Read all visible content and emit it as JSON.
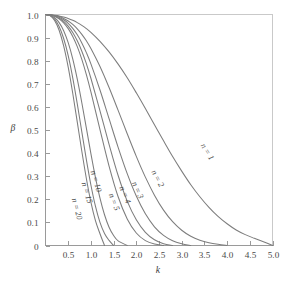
{
  "chart_data": {
    "type": "line",
    "title": "",
    "subtitle": "",
    "xlabel": "k",
    "ylabel": "β",
    "xlim": [
      0,
      5
    ],
    "ylim": [
      0,
      1
    ],
    "grid": false,
    "legend_position": "inline-curve-labels",
    "xticks": [
      0.5,
      1.0,
      1.5,
      2.0,
      2.5,
      3.0,
      3.5,
      4.0,
      4.5,
      5.0
    ],
    "xtick_labels": [
      "0.5",
      "1.0",
      "1.5",
      "2.0",
      "2.5",
      "3.0",
      "3.5",
      "4.0",
      "4.5",
      "5.0"
    ],
    "yticks": [
      0,
      0.1,
      0.2,
      0.3,
      0.4,
      0.5,
      0.6,
      0.7,
      0.8,
      0.9,
      1.0
    ],
    "ytick_labels": [
      "0",
      "0.1",
      "0.2",
      "0.3",
      "0.4",
      "0.5",
      "0.6",
      "0.7",
      "0.8",
      "0.9",
      "1.0"
    ],
    "series": [
      {
        "name": "n = 1",
        "label": "n = 1",
        "label_x": 3.52,
        "label_y": 0.4,
        "label_rotation": 58,
        "x": [
          0.0,
          0.1,
          0.2,
          0.3,
          0.4,
          0.5,
          0.6,
          0.7,
          0.8,
          0.9,
          1.0,
          1.2,
          1.4,
          1.6,
          1.8,
          2.0,
          2.2,
          2.4,
          2.6,
          2.8,
          3.0,
          3.2,
          3.4,
          3.6,
          3.8,
          4.0,
          4.2,
          4.4,
          4.6,
          4.8,
          5.0
        ],
        "y": [
          1.0,
          0.999,
          0.997,
          0.994,
          0.989,
          0.983,
          0.975,
          0.965,
          0.953,
          0.939,
          0.923,
          0.884,
          0.838,
          0.785,
          0.726,
          0.661,
          0.593,
          0.523,
          0.453,
          0.385,
          0.322,
          0.263,
          0.211,
          0.165,
          0.126,
          0.094,
          0.067,
          0.047,
          0.031,
          0.016,
          0.0
        ]
      },
      {
        "name": "n = 2",
        "label": "n = 2",
        "label_x": 2.42,
        "label_y": 0.285,
        "label_rotation": 62,
        "x": [
          0.0,
          0.1,
          0.2,
          0.3,
          0.4,
          0.5,
          0.6,
          0.7,
          0.8,
          0.9,
          1.0,
          1.2,
          1.4,
          1.6,
          1.8,
          2.0,
          2.2,
          2.4,
          2.6,
          2.8,
          3.0,
          3.2,
          3.4,
          3.6,
          3.8,
          4.0
        ],
        "y": [
          1.0,
          0.999,
          0.996,
          0.991,
          0.983,
          0.972,
          0.957,
          0.938,
          0.914,
          0.886,
          0.853,
          0.775,
          0.684,
          0.585,
          0.484,
          0.386,
          0.296,
          0.218,
          0.153,
          0.103,
          0.066,
          0.04,
          0.023,
          0.012,
          0.005,
          0.0
        ]
      },
      {
        "name": "n = 3",
        "label": "n = 3",
        "label_x": 1.98,
        "label_y": 0.235,
        "label_rotation": 66,
        "x": [
          0.0,
          0.1,
          0.2,
          0.3,
          0.4,
          0.5,
          0.6,
          0.7,
          0.8,
          0.9,
          1.0,
          1.2,
          1.4,
          1.6,
          1.8,
          2.0,
          2.2,
          2.4,
          2.6,
          2.8,
          3.0,
          3.2
        ],
        "y": [
          1.0,
          0.999,
          0.995,
          0.988,
          0.977,
          0.962,
          0.94,
          0.912,
          0.877,
          0.835,
          0.786,
          0.673,
          0.549,
          0.425,
          0.311,
          0.214,
          0.137,
          0.081,
          0.044,
          0.021,
          0.008,
          0.0
        ]
      },
      {
        "name": "n = 4",
        "label": "n = 4",
        "label_x": 1.7,
        "label_y": 0.215,
        "label_rotation": 68,
        "x": [
          0.0,
          0.1,
          0.2,
          0.3,
          0.4,
          0.5,
          0.6,
          0.7,
          0.8,
          0.9,
          1.0,
          1.2,
          1.4,
          1.6,
          1.8,
          2.0,
          2.2,
          2.4,
          2.6,
          2.8
        ],
        "y": [
          1.0,
          0.998,
          0.993,
          0.984,
          0.97,
          0.95,
          0.922,
          0.886,
          0.841,
          0.787,
          0.724,
          0.583,
          0.438,
          0.303,
          0.192,
          0.111,
          0.057,
          0.025,
          0.008,
          0.0
        ]
      },
      {
        "name": "n = 5",
        "label": "n = 5",
        "label_x": 1.46,
        "label_y": 0.185,
        "label_rotation": 70,
        "x": [
          0.0,
          0.1,
          0.2,
          0.3,
          0.4,
          0.5,
          0.6,
          0.7,
          0.8,
          0.9,
          1.0,
          1.2,
          1.4,
          1.6,
          1.8,
          2.0,
          2.2,
          2.4,
          2.6
        ],
        "y": [
          1.0,
          0.998,
          0.992,
          0.981,
          0.964,
          0.939,
          0.905,
          0.861,
          0.806,
          0.74,
          0.665,
          0.502,
          0.344,
          0.211,
          0.115,
          0.054,
          0.021,
          0.006,
          0.0
        ]
      },
      {
        "name": "n = 10",
        "label": "n = 10",
        "label_x": 1.06,
        "label_y": 0.275,
        "label_rotation": 73,
        "x": [
          0.0,
          0.1,
          0.2,
          0.3,
          0.4,
          0.5,
          0.6,
          0.7,
          0.8,
          0.9,
          1.0,
          1.1,
          1.2,
          1.3,
          1.4,
          1.5,
          1.6,
          1.8
        ],
        "y": [
          1.0,
          0.997,
          0.986,
          0.965,
          0.93,
          0.878,
          0.808,
          0.72,
          0.618,
          0.508,
          0.398,
          0.295,
          0.205,
          0.133,
          0.079,
          0.043,
          0.02,
          0.0
        ]
      },
      {
        "name": "n = 15",
        "label": "n = 15",
        "label_x": 0.86,
        "label_y": 0.225,
        "label_rotation": 74,
        "x": [
          0.0,
          0.1,
          0.2,
          0.3,
          0.4,
          0.5,
          0.6,
          0.7,
          0.8,
          0.9,
          1.0,
          1.1,
          1.2,
          1.3,
          1.4,
          1.5
        ],
        "y": [
          1.0,
          0.996,
          0.98,
          0.948,
          0.896,
          0.822,
          0.726,
          0.613,
          0.492,
          0.372,
          0.262,
          0.17,
          0.1,
          0.052,
          0.022,
          0.0
        ]
      },
      {
        "name": "n = 20",
        "label": "n = 20",
        "label_x": 0.64,
        "label_y": 0.155,
        "label_rotation": 75,
        "x": [
          0.0,
          0.1,
          0.2,
          0.3,
          0.4,
          0.5,
          0.6,
          0.7,
          0.8,
          0.9,
          1.0,
          1.1,
          1.2,
          1.3
        ],
        "y": [
          1.0,
          0.995,
          0.974,
          0.932,
          0.864,
          0.772,
          0.659,
          0.534,
          0.408,
          0.29,
          0.188,
          0.108,
          0.051,
          0.0
        ]
      }
    ]
  },
  "axes": {
    "x_title": "k",
    "y_title": "β"
  },
  "colors": {
    "curve": "#7d7d7d",
    "axis": "#9a9a9a",
    "frame": "#c9c9c9",
    "text": "#4a4a4a",
    "background": "#ffffff"
  }
}
